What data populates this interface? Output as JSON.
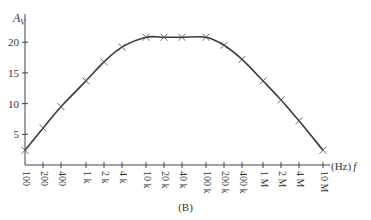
{
  "chart_data": {
    "type": "line",
    "title": "",
    "caption": "(B)",
    "xlabel": "(Hz) f",
    "ylabel": "A_V",
    "x_scale": "log",
    "categories": [
      "100",
      "200",
      "400",
      "1 k",
      "2 k",
      "4 k",
      "10 k",
      "20 k",
      "40 k",
      "100 k",
      "200 k",
      "400 k",
      "1 M",
      "2 M",
      "4 M",
      "10 M"
    ],
    "x": [
      100,
      200,
      400,
      1000,
      2000,
      4000,
      10000,
      20000,
      40000,
      100000,
      200000,
      400000,
      1000000,
      2000000,
      4000000,
      10000000
    ],
    "series": [
      {
        "name": "A_V",
        "marker": "x",
        "values": [
          2.4,
          6.0,
          9.5,
          13.7,
          16.8,
          19.2,
          20.8,
          20.8,
          20.8,
          20.8,
          19.5,
          17.2,
          13.7,
          10.6,
          7.2,
          2.4
        ]
      }
    ],
    "y_ticks": [
      5,
      10,
      15,
      20
    ],
    "ylim": [
      0,
      23
    ],
    "grid": false,
    "legend": "none"
  },
  "axes": {
    "y_label_main": "A",
    "y_label_sub": "V",
    "x_unit": "(Hz)",
    "x_symbol": "f"
  }
}
